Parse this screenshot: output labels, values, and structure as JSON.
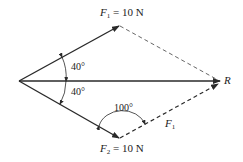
{
  "diagram": {
    "type": "vector-addition",
    "colors": {
      "line": "#2a2a2a",
      "text": "#222222",
      "background": "#ffffff"
    },
    "vectors": {
      "f1": {
        "symbol": "F",
        "subscript": "1",
        "eq": " = 10 N"
      },
      "f2": {
        "symbol": "F",
        "subscript": "2",
        "eq": " = 10 N"
      },
      "resultant": {
        "symbol": "R"
      },
      "translated_f1": {
        "symbol": "F",
        "subscript": "1"
      }
    },
    "angles": {
      "upper": "40°",
      "lower": "40°",
      "parallelogram": "100°"
    }
  }
}
